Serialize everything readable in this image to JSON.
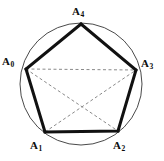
{
  "figure": {
    "background_color": "#ffffff",
    "circle": {
      "name": "circumscribed-circle",
      "center_x": 81,
      "center_y": 84,
      "radius": 61,
      "stroke_color": "#4a4a4a",
      "stroke_width": 1
    },
    "pentagon": {
      "name": "pentagon-outline",
      "stroke_color": "#111111",
      "stroke_width": 3,
      "fill": "none"
    },
    "diagonals": {
      "name": "pentagon-diagonals",
      "stroke_color": "#8a8a8a",
      "stroke_width": 1,
      "dash_pattern": "3,2.5"
    },
    "vertices": [
      {
        "id": "A0",
        "label": "A",
        "subscript": "0",
        "x": 26,
        "y": 69
      },
      {
        "id": "A1",
        "label": "A",
        "subscript": "1",
        "x": 45,
        "y": 132
      },
      {
        "id": "A2",
        "label": "A",
        "subscript": "2",
        "x": 118,
        "y": 131
      },
      {
        "id": "A3",
        "label": "A",
        "subscript": "3",
        "x": 136,
        "y": 70
      },
      {
        "id": "A4",
        "label": "A",
        "subscript": "4",
        "x": 81,
        "y": 24
      }
    ],
    "edges": [
      [
        "A0",
        "A1"
      ],
      [
        "A1",
        "A2"
      ],
      [
        "A2",
        "A3"
      ],
      [
        "A3",
        "A4"
      ],
      [
        "A4",
        "A0"
      ]
    ],
    "dashed_diagonals": [
      [
        "A0",
        "A2"
      ],
      [
        "A0",
        "A3"
      ],
      [
        "A1",
        "A3"
      ]
    ]
  },
  "labels": {
    "A4": {
      "text": "A",
      "sub": "4"
    },
    "A0": {
      "text": "A",
      "sub": "0"
    },
    "A3": {
      "text": "A",
      "sub": "3"
    },
    "A1": {
      "text": "A",
      "sub": "1"
    },
    "A2": {
      "text": "A",
      "sub": "2"
    }
  }
}
